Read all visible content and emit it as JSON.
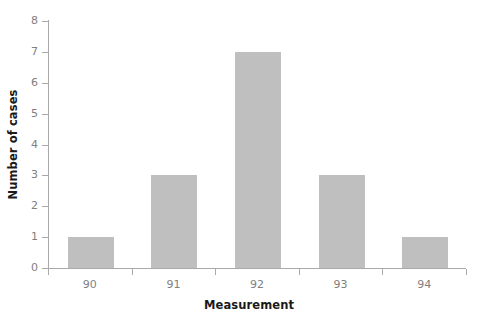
{
  "chart_data": {
    "type": "bar",
    "title": "",
    "subtitle": "",
    "xlabel": "Measurement",
    "ylabel": "Number of cases",
    "categories": [
      "90",
      "91",
      "92",
      "93",
      "94"
    ],
    "values": [
      1,
      3,
      7,
      3,
      1
    ],
    "series": [
      {
        "name": "Number of cases",
        "values": [
          1,
          3,
          7,
          3,
          1
        ]
      }
    ],
    "ylim": [
      0,
      8
    ],
    "yticks": [
      0,
      1,
      2,
      3,
      4,
      5,
      6,
      7,
      8
    ],
    "ytick_labels": [
      "0",
      "1",
      "2",
      "3",
      "4",
      "5",
      "6",
      "7",
      "8"
    ],
    "xtick_labels": [
      "90",
      "91",
      "92",
      "93",
      "94"
    ],
    "grid": false,
    "legend": false,
    "legend_position": "none",
    "annotations": [],
    "colors": {
      "background": "#ffffff",
      "bar_fill": "#bfbfbf",
      "axis_line": "#aaaaaa",
      "tick_label": "#808080",
      "axis_title": "#1a1a1a"
    }
  }
}
